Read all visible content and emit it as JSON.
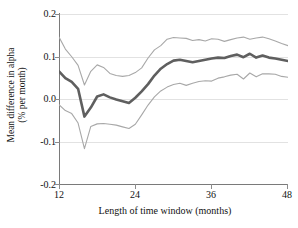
{
  "chart_data": {
    "type": "line",
    "title": "",
    "subtitle": "",
    "xlabel": "Length of time window (months)",
    "ylabel_line1": "Mean difference in alpha",
    "ylabel_line2": "(% per month)",
    "ylabel": "Mean difference in alpha (% per month)",
    "xlim": [
      12,
      48
    ],
    "ylim": [
      -0.2,
      0.2
    ],
    "xticks": [
      12,
      24,
      36,
      48
    ],
    "xtick_labels": [
      "12",
      "24",
      "36",
      "48"
    ],
    "yticks": [
      -0.2,
      -0.1,
      0.0,
      0.1,
      0.2
    ],
    "ytick_labels": [
      "0.2",
      "0.1",
      "0.0",
      "-0.1",
      "-0.2"
    ],
    "grid": true,
    "grid_axis": "y",
    "legend": false,
    "legend_position": "none",
    "colors": {
      "mean": "#666666",
      "bounds": "#aaaaaa",
      "grid": "#e2e2e2",
      "axis": "#7a7a7a"
    },
    "x": [
      12,
      13,
      14,
      15,
      16,
      17,
      18,
      19,
      20,
      21,
      22,
      23,
      24,
      25,
      26,
      27,
      28,
      29,
      30,
      31,
      32,
      33,
      34,
      35,
      36,
      37,
      38,
      39,
      40,
      41,
      42,
      43,
      44,
      45,
      46,
      47,
      48
    ],
    "series": [
      {
        "name": "Upper confidence bound",
        "style": "thin",
        "values": [
          0.146,
          0.118,
          0.1,
          0.08,
          0.034,
          0.066,
          0.081,
          0.075,
          0.061,
          0.056,
          0.054,
          0.056,
          0.063,
          0.074,
          0.097,
          0.116,
          0.126,
          0.141,
          0.145,
          0.144,
          0.143,
          0.138,
          0.14,
          0.137,
          0.142,
          0.141,
          0.136,
          0.14,
          0.144,
          0.146,
          0.141,
          0.144,
          0.146,
          0.142,
          0.137,
          0.131,
          0.126
        ]
      },
      {
        "name": "Mean difference in alpha",
        "style": "thick",
        "values": [
          0.066,
          0.05,
          0.041,
          0.025,
          -0.04,
          -0.019,
          0.007,
          0.012,
          0.005,
          0.0,
          -0.004,
          -0.008,
          0.004,
          0.019,
          0.036,
          0.056,
          0.072,
          0.083,
          0.091,
          0.093,
          0.09,
          0.087,
          0.09,
          0.093,
          0.096,
          0.098,
          0.097,
          0.102,
          0.105,
          0.099,
          0.107,
          0.098,
          0.103,
          0.098,
          0.096,
          0.093,
          0.09
        ]
      },
      {
        "name": "Lower confidence bound",
        "style": "thin",
        "values": [
          -0.012,
          -0.026,
          -0.033,
          -0.055,
          -0.115,
          -0.063,
          -0.057,
          -0.056,
          -0.058,
          -0.06,
          -0.064,
          -0.068,
          -0.058,
          -0.036,
          -0.013,
          0.006,
          0.02,
          0.029,
          0.035,
          0.038,
          0.033,
          0.038,
          0.042,
          0.044,
          0.043,
          0.05,
          0.053,
          0.057,
          0.059,
          0.048,
          0.062,
          0.053,
          0.06,
          0.06,
          0.059,
          0.054,
          0.052
        ]
      }
    ]
  }
}
